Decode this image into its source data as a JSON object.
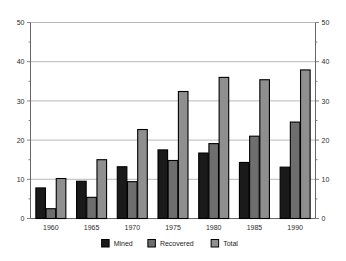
{
  "chart_data": {
    "type": "bar",
    "title": "",
    "subtitle": "",
    "xlabel": "",
    "ylabel": "",
    "categories": [
      "1960",
      "1965",
      "1970",
      "1975",
      "1980",
      "1985",
      "1990"
    ],
    "series": [
      {
        "name": "Mined",
        "color": "#1a1a1a",
        "values": [
          7.8,
          9.5,
          13.2,
          17.5,
          16.7,
          14.3,
          13.1
        ]
      },
      {
        "name": "Recovered",
        "color": "#6e6e6e",
        "values": [
          2.5,
          5.4,
          9.4,
          14.8,
          19.1,
          21.0,
          24.6
        ]
      },
      {
        "name": "Total",
        "color": "#8f8f8f",
        "values": [
          10.2,
          15.0,
          22.7,
          32.4,
          36.0,
          35.4,
          37.9
        ]
      }
    ],
    "ylim": [
      0,
      50
    ],
    "yticks": [
      0,
      10,
      20,
      30,
      40,
      50
    ],
    "yticks_minor": [
      5,
      15,
      25,
      35,
      45
    ],
    "ytick_labels_left": [
      "0",
      "10",
      "20",
      "30",
      "40",
      "50"
    ],
    "ytick_labels_right": [
      "0",
      "10",
      "20",
      "30",
      "40",
      "50"
    ],
    "grid": true,
    "grid_axis": "y",
    "legend_position": "bottom",
    "legend_entries": [
      "Mined",
      "Recovered",
      "Total"
    ],
    "bar_outline_color": "#000000",
    "background_color": "#ffffff"
  }
}
